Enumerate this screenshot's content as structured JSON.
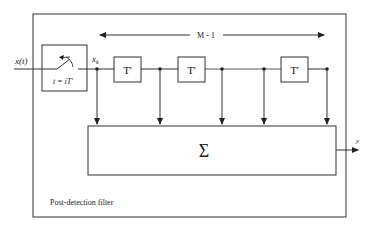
{
  "diagram": {
    "title": "Post-detection filter",
    "input_label": "x(t)",
    "sampler": {
      "time_label": "t = iT'"
    },
    "sample_label_base": "x",
    "sample_label_sub": "k",
    "span_label": "M - 1",
    "delays": [
      {
        "label": "T'"
      },
      {
        "label": "T'"
      },
      {
        "label": "T'"
      }
    ],
    "summer_label": "Σ",
    "output_label": "y",
    "colors": {
      "line": "#333333",
      "background": "#ffffff"
    }
  }
}
